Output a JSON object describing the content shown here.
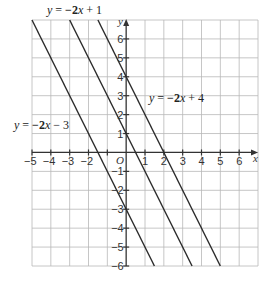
{
  "figure": {
    "x_axis_label": "x",
    "y_axis_label": "y",
    "origin_label": "O",
    "x_range": [
      -5,
      7
    ],
    "y_range": [
      -6,
      7
    ],
    "x_ticks": [
      "-5",
      "-4",
      "-3",
      "-2",
      "1",
      "2",
      "3",
      "4",
      "5",
      "6"
    ],
    "y_ticks": [
      "6",
      "5",
      "4",
      "3",
      "2",
      "1",
      "-1",
      "-2",
      "-3",
      "-4",
      "-5",
      "-6"
    ],
    "lines": [
      {
        "name": "y = -2x + 1",
        "label": "y = −2x + 1",
        "slope": -2,
        "intercept": 1
      },
      {
        "name": "y = -2x + 4",
        "label": "y = −2x + 4",
        "slope": -2,
        "intercept": 4
      },
      {
        "name": "y = -2x - 3",
        "label": "y = −2x − 3",
        "slope": -2,
        "intercept": -3
      }
    ],
    "line_color": "#2a2a2a",
    "grid_color": "#b8b8b8"
  },
  "labels": {
    "eq1": {
      "y": "y",
      "eq": " = ",
      "coef": "−2",
      "x": "x",
      "rest": " + 1"
    },
    "eq2": {
      "y": "y",
      "eq": " = ",
      "coef": "−2",
      "x": "x",
      "rest": " + 4"
    },
    "eq3": {
      "y": "y",
      "eq": " = ",
      "coef": "−2",
      "x": "x",
      "rest": " − 3"
    }
  }
}
